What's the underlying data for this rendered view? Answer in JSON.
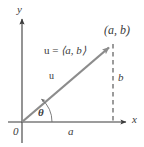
{
  "figure": {
    "colors": {
      "axis": "#3b3b3b",
      "vector": "#8c8c8c",
      "dashed": "#4a4a4a",
      "arc": "#6e6e6e",
      "text": "#3b3b3b",
      "background": "#ffffff"
    },
    "axes": {
      "y_label": "y",
      "x_label": "x",
      "origin_label": "0"
    },
    "labels": {
      "point": "(a, b)",
      "vector_definition_name": "u",
      "vector_definition_equals": "=",
      "vector_definition_components": "⟨a, b⟩",
      "vector_name": "u",
      "angle": "θ",
      "horizontal_component": "a",
      "vertical_component": "b"
    },
    "geometry": {
      "origin_x": 22,
      "origin_y": 122,
      "tip_x": 113,
      "tip_y": 44,
      "y_axis_top": 15,
      "x_axis_right": 130,
      "arc_radius": 30
    }
  }
}
